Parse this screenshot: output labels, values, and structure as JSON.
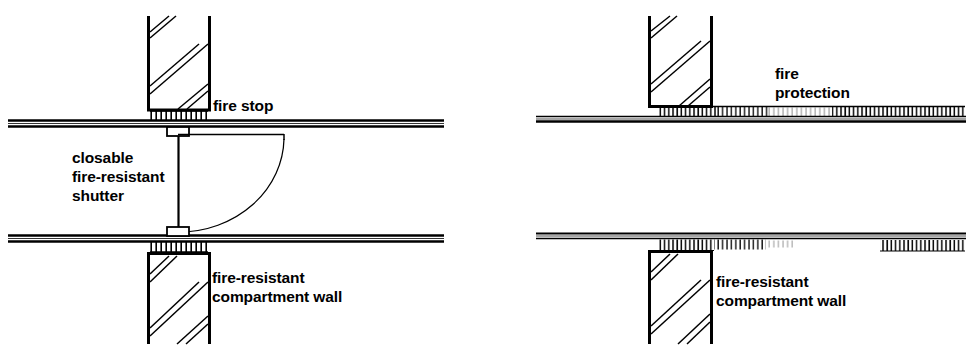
{
  "figure": {
    "background_color": "#ffffff",
    "line_color": "#000000",
    "panels": [
      {
        "id": "left-panel",
        "name": "closable-fire-resistant-shutter-detail",
        "labels": [
          {
            "id": "fire-stop",
            "text": "fire stop",
            "x": 213,
            "y": 96
          },
          {
            "id": "closable-shutter",
            "text": "closable\nfire-resistant\nshutter",
            "x": 72,
            "y": 148
          },
          {
            "id": "compartment-wall-left",
            "text": "fire-resistant\ncompartment wall",
            "x": 212,
            "y": 268
          }
        ]
      },
      {
        "id": "right-panel",
        "name": "fire-protection-detail",
        "labels": [
          {
            "id": "fire-protection",
            "text": "fire\nprotection",
            "x": 775,
            "y": 64
          },
          {
            "id": "compartment-wall-right",
            "text": "fire-resistant\ncompartment wall",
            "x": 716,
            "y": 272
          }
        ]
      }
    ]
  },
  "elements": {
    "ceiling_slab_label": "ceiling slab",
    "floor_slab_label": "floor slab",
    "upper_wall_label": "upper compartment wall",
    "lower_wall_label": "lower compartment wall",
    "fire_stop_label": "fire stop packing",
    "shutter_label": "shutter leaf",
    "swing_arc_label": "shutter swing arc",
    "fire_protection_label": "fire protection lining"
  }
}
